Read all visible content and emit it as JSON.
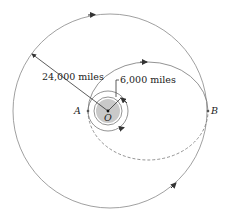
{
  "diagram": {
    "type": "orbital-transfer",
    "labels": {
      "outer_radius": "24,000 miles",
      "inner_radius": "6,000 miles",
      "point_a": "A",
      "point_b": "B",
      "center": "O"
    },
    "colors": {
      "line": "#777777",
      "earth": "#c9c9c9",
      "text": "#222222",
      "arrow": "#333333"
    },
    "elements": [
      "outer circular orbit (radius 24,000 miles)",
      "inner circular orbit (radius 6,000 miles)",
      "Earth centered at O",
      "transfer ellipse from A to B (solid upper half, dashed lower half)",
      "large ellipse through B (solid)"
    ]
  }
}
